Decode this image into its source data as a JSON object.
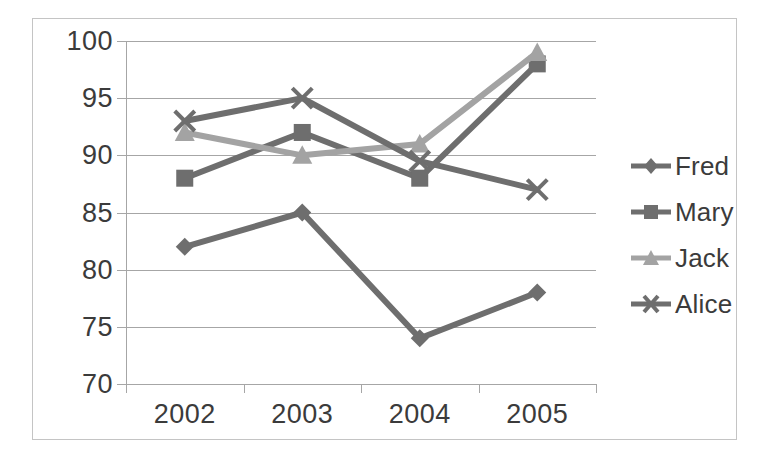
{
  "chart_data": {
    "type": "line",
    "title": "",
    "xlabel": "",
    "ylabel": "",
    "categories": [
      "2002",
      "2003",
      "2004",
      "2005"
    ],
    "ylim": [
      70,
      100
    ],
    "yticks": [
      70,
      75,
      80,
      85,
      90,
      95,
      100
    ],
    "grid": true,
    "legend_position": "right",
    "series": [
      {
        "name": "Fred",
        "marker": "diamond",
        "color": "#6e6e6e",
        "values": [
          82,
          85,
          74,
          78
        ]
      },
      {
        "name": "Mary",
        "marker": "square",
        "color": "#6e6e6e",
        "values": [
          88,
          92,
          88,
          98
        ]
      },
      {
        "name": "Jack",
        "marker": "triangle",
        "color": "#a3a3a3",
        "values": [
          92,
          90,
          91,
          99
        ]
      },
      {
        "name": "Alice",
        "marker": "cross",
        "color": "#6e6e6e",
        "values": [
          93,
          95,
          89.5,
          87
        ]
      }
    ]
  },
  "axis": {
    "y_tick_labels": [
      "100",
      "95",
      "90",
      "85",
      "80",
      "75",
      "70"
    ],
    "x_tick_labels": [
      "2002",
      "2003",
      "2004",
      "2005"
    ]
  },
  "legend": {
    "items": [
      {
        "label": "Fred"
      },
      {
        "label": "Mary"
      },
      {
        "label": "Jack"
      },
      {
        "label": "Alice"
      }
    ]
  },
  "colors": {
    "grid": "#a6a6a6",
    "frame": "#c4c4c4",
    "text": "#3b3b3b",
    "series_dark": "#6e6e6e",
    "series_light": "#a3a3a3"
  }
}
